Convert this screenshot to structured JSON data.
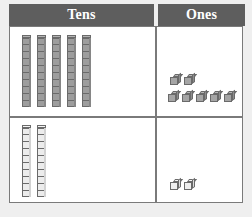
{
  "chart_data": {
    "type": "table",
    "columns": [
      "Tens",
      "Ones"
    ],
    "rows": [
      {
        "label": "row-1",
        "tens_blocks": 5,
        "ones_blocks": 7,
        "tens_value": 50,
        "ones_value": 7,
        "total": 57,
        "block_style": "dark"
      },
      {
        "label": "row-2",
        "tens_blocks": 2,
        "ones_blocks": 2,
        "tens_value": 20,
        "ones_value": 2,
        "total": 22,
        "block_style": "light"
      }
    ],
    "cubes_per_rod": 10,
    "ones_layout": {
      "row_1_top": 2,
      "row_1_bottom": 5,
      "row_2_bottom": 2
    }
  },
  "header": {
    "tens_label": "Tens",
    "ones_label": "Ones"
  },
  "colors": {
    "header_background": "#5e5e5e",
    "header_text": "#ffffff",
    "border": "#7a7a7a",
    "cell_background": "#ffffff",
    "page_background": "#efefef",
    "block_dark": "#9d9d9d",
    "block_light": "#ececec",
    "block_outline": "#6a6a6a"
  }
}
